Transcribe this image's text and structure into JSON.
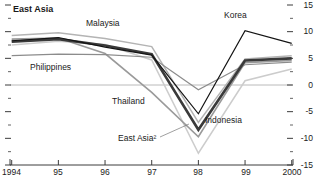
{
  "title": "East Asia",
  "labels": {
    "malaysia": "Malaysia",
    "korea": "Korea",
    "philippines": "Philippines",
    "thailand": "Thailand",
    "east_asia": "East Asia²",
    "indonesia": "Indonesia"
  },
  "chart_data": {
    "type": "line",
    "title": "East Asia",
    "x": [
      1994,
      1995,
      1996,
      1997,
      1998,
      1999,
      2000
    ],
    "x_tick_labels": [
      "1994",
      "95",
      "96",
      "97",
      "98",
      "99",
      "2000"
    ],
    "y_ticks": [
      15,
      10,
      5,
      0,
      -5,
      -10,
      -15
    ],
    "y_tick_labels": [
      "15",
      "10",
      "5",
      "0",
      "-5",
      "-10",
      "-15"
    ],
    "y_minor_ticks": [
      12.5,
      7.5,
      2.5,
      -2.5,
      -7.5,
      -12.5
    ],
    "ylim": [
      -15,
      15
    ],
    "grid": "zero-line-only",
    "legend": "inline-labels",
    "ylabel": "",
    "xlabel": "",
    "series": [
      {
        "name": "Indonesia",
        "values": [
          7.5,
          8.2,
          7.6,
          4.7,
          -12.8,
          0.8,
          3.0
        ],
        "color": "#cccccc",
        "width": 1.5
      },
      {
        "name": "Malaysia",
        "values": [
          9.3,
          9.8,
          8.7,
          7.2,
          -7.0,
          4.9,
          5.5
        ],
        "color": "#b4b4b4",
        "width": 1.5
      },
      {
        "name": "Thailand",
        "values": [
          8.6,
          8.8,
          5.9,
          -1.4,
          -9.7,
          4.2,
          4.6
        ],
        "color": "#9a9a9a",
        "width": 1.6
      },
      {
        "name": "Philippines",
        "values": [
          5.5,
          5.8,
          5.7,
          5.2,
          -0.9,
          3.8,
          4.3
        ],
        "color": "#8c8c8c",
        "width": 1.2
      },
      {
        "name": "East Asia²",
        "values": [
          8.1,
          8.6,
          7.4,
          5.8,
          -8.4,
          4.6,
          5.0
        ],
        "color": "#3a3a3a",
        "width": 2.6
      },
      {
        "name": "Korea",
        "values": [
          8.3,
          8.9,
          7.1,
          5.6,
          -5.4,
          10.2,
          7.8
        ],
        "color": "#141414",
        "width": 1.2
      }
    ],
    "annotation_leader": {
      "from_series": "East Asia²",
      "note": "label points to line at 1998 trough"
    },
    "axis_color": "#3c3c3c",
    "zero_line_color": "#a8a8a8"
  }
}
